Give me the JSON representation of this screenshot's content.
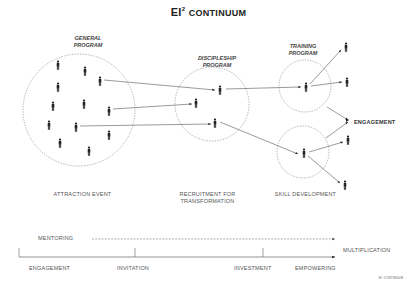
{
  "title": {
    "prefix": "EI",
    "superscript": "2",
    "rest": "Continuum"
  },
  "programs": [
    {
      "id": "general",
      "label_line1": "GENERAL",
      "label_line2": "PROGRAM",
      "stage_label_line1": "ATTRACTION EVENT",
      "stage_label_line2": ""
    },
    {
      "id": "discipleship",
      "label_line1": "DISCIPLESHIP",
      "label_line2": "PROGRAM",
      "stage_label_line1": "RECRUITMENT FOR",
      "stage_label_line2": "TRANSFORMATION"
    },
    {
      "id": "training",
      "label_line1": "TRAINING",
      "label_line2": "PROGRAM",
      "stage_label_line1": "SKILL DEVELOPMENT",
      "stage_label_line2": ""
    }
  ],
  "engagement_label": "ENGAGEMENT",
  "timeline": {
    "mentoring_label": "MENTORING",
    "multiplication_label": "MULTIPLICATION",
    "stages": [
      "ENGAGEMENT",
      "INVITATION",
      "INVESTMENT",
      "EMPOWERING"
    ]
  },
  "footer": "EI² CONTINUUM",
  "colors": {
    "line": "#555555",
    "figure": "#222222",
    "circle": "#888888"
  }
}
